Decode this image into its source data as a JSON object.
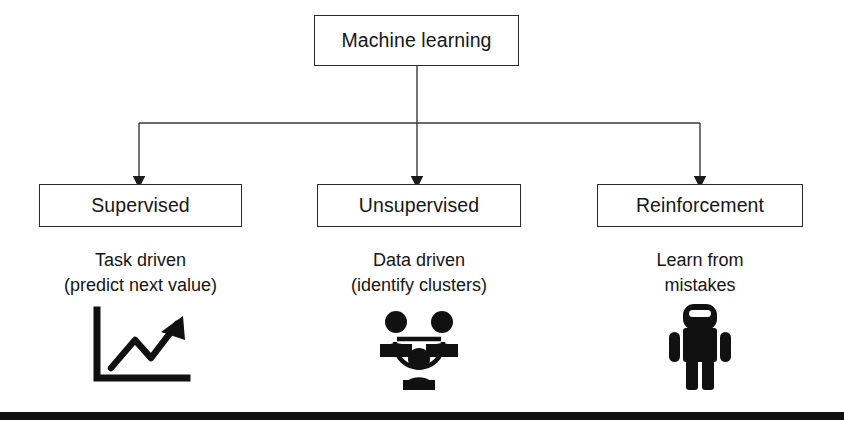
{
  "diagram": {
    "title_node": {
      "label": "Machine learning"
    },
    "branches": [
      {
        "id": "supervised",
        "label": "Supervised",
        "caption_line1": "Task driven",
        "caption_line2": "(predict next value)",
        "icon": "line-chart-up-arrow-icon"
      },
      {
        "id": "unsupervised",
        "label": "Unsupervised",
        "caption_line1": "Data driven",
        "caption_line2": "(identify clusters)",
        "icon": "people-cluster-icon"
      },
      {
        "id": "reinforcement",
        "label": "Reinforcement",
        "caption_line1": "Learn from",
        "caption_line2": "mistakes",
        "icon": "robot-figure-icon"
      }
    ]
  },
  "colors": {
    "ink": "#111111",
    "box_border": "#2b2b2b",
    "background": "#ffffff",
    "rule": "#111111"
  }
}
